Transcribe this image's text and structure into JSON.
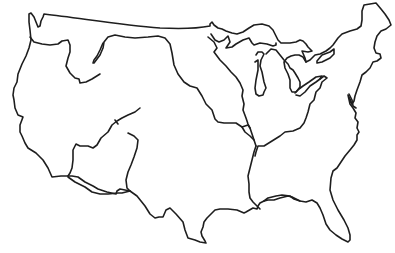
{
  "map": {
    "subject": "Outline map of the contiguous United States",
    "style": "hand-drawn black line art on white background",
    "stroke_color": "#1e1e1e",
    "background_color": "#ffffff",
    "features": [
      {
        "id": "national-border",
        "label": "Contiguous U.S. outline including Great Lakes shoreline and coasts"
      },
      {
        "id": "great-lakes",
        "label": "Great Lakes (Superior, Michigan, Huron, Erie, Ontario)"
      },
      {
        "id": "columbia-snake-line",
        "label": "Northwestern river boundary"
      },
      {
        "id": "continental-divide-line",
        "label": "Central-western boundary (Missouri watershed edge)"
      },
      {
        "id": "colorado-line",
        "label": "Southwestern river boundary"
      },
      {
        "id": "rio-grande-line",
        "label": "Rio Grande / Gulf watershed boundary"
      },
      {
        "id": "mississippi-line",
        "label": "Mississippi River / Ohio River boundary"
      },
      {
        "id": "chesapeake",
        "label": "Chesapeake Bay inlet"
      }
    ],
    "labels": []
  }
}
